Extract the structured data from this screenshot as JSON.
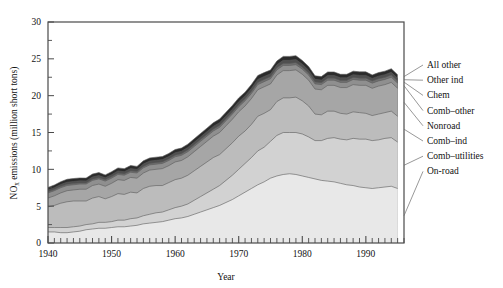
{
  "chart_data": {
    "type": "area",
    "stacked": true,
    "title": "",
    "xlabel": "Year",
    "ylabel": "NOx emissions (million short tons)",
    "ylabel_parts": {
      "prefix": "NO",
      "subscript": "x",
      "suffix": " emissions (million short tons)"
    },
    "xlim": [
      1940,
      1996
    ],
    "ylim": [
      0,
      30
    ],
    "ytick_labels": [
      "0",
      "5",
      "10",
      "15",
      "20",
      "25",
      "30"
    ],
    "ytick_values": [
      0,
      5,
      10,
      15,
      20,
      25,
      30
    ],
    "yminor_step": 2.5,
    "xtick_labels": [
      "1940",
      "1950",
      "1960",
      "1970",
      "1980",
      "1990"
    ],
    "xtick_values": [
      1940,
      1950,
      1960,
      1970,
      1980,
      1990
    ],
    "xminor_step": 1,
    "grid": false,
    "legend_position": "right-outside",
    "legend_order_top_to_bottom": [
      "All other",
      "Other ind",
      "Chem",
      "Comb-other",
      "Nonroad",
      "Comb-ind",
      "Comb-utilities",
      "On-road"
    ],
    "x": [
      1940,
      1941,
      1942,
      1943,
      1944,
      1945,
      1946,
      1947,
      1948,
      1949,
      1950,
      1951,
      1952,
      1953,
      1954,
      1955,
      1956,
      1957,
      1958,
      1959,
      1960,
      1961,
      1962,
      1963,
      1964,
      1965,
      1966,
      1967,
      1968,
      1969,
      1970,
      1971,
      1972,
      1973,
      1974,
      1975,
      1976,
      1977,
      1978,
      1979,
      1980,
      1981,
      1982,
      1983,
      1984,
      1985,
      1986,
      1987,
      1988,
      1989,
      1990,
      1991,
      1992,
      1993,
      1994,
      1995
    ],
    "series": [
      {
        "name": "On-road",
        "color": "#e8e8e8",
        "values": [
          1.5,
          1.5,
          1.4,
          1.4,
          1.5,
          1.6,
          1.8,
          1.9,
          2.0,
          2.0,
          2.1,
          2.2,
          2.2,
          2.3,
          2.4,
          2.6,
          2.7,
          2.8,
          2.9,
          3.1,
          3.3,
          3.4,
          3.6,
          3.9,
          4.2,
          4.5,
          4.8,
          5.1,
          5.5,
          5.9,
          6.4,
          6.9,
          7.4,
          7.9,
          8.3,
          8.8,
          9.1,
          9.3,
          9.4,
          9.3,
          9.1,
          8.9,
          8.7,
          8.5,
          8.4,
          8.3,
          8.1,
          7.9,
          7.8,
          7.6,
          7.5,
          7.4,
          7.5,
          7.6,
          7.7,
          7.4
        ]
      },
      {
        "name": "Comb-utilities",
        "color": "#d2d2d2",
        "values": [
          0.6,
          0.6,
          0.7,
          0.7,
          0.7,
          0.7,
          0.7,
          0.7,
          0.8,
          0.8,
          0.8,
          0.9,
          0.9,
          1.0,
          1.0,
          1.1,
          1.2,
          1.3,
          1.3,
          1.4,
          1.5,
          1.6,
          1.7,
          1.9,
          2.1,
          2.3,
          2.5,
          2.7,
          3.0,
          3.3,
          3.6,
          3.9,
          4.2,
          4.6,
          4.7,
          5.0,
          5.5,
          5.7,
          5.6,
          5.7,
          5.7,
          5.5,
          5.2,
          5.4,
          5.8,
          6.0,
          6.0,
          6.1,
          6.4,
          6.5,
          6.6,
          6.5,
          6.5,
          6.6,
          6.6,
          6.3
        ]
      },
      {
        "name": "Comb-ind",
        "color": "#bcbcbc",
        "values": [
          2.8,
          3.0,
          3.3,
          3.5,
          3.5,
          3.4,
          3.2,
          3.5,
          3.5,
          3.2,
          3.4,
          3.6,
          3.5,
          3.6,
          3.4,
          3.7,
          3.8,
          3.7,
          3.6,
          3.7,
          3.8,
          3.8,
          3.9,
          4.0,
          4.1,
          4.2,
          4.3,
          4.2,
          4.3,
          4.4,
          4.5,
          4.4,
          4.5,
          4.7,
          4.6,
          4.3,
          4.6,
          4.7,
          4.7,
          4.8,
          4.5,
          4.2,
          3.6,
          3.5,
          3.7,
          3.6,
          3.5,
          3.5,
          3.6,
          3.6,
          3.5,
          3.4,
          3.5,
          3.5,
          3.6,
          3.5
        ]
      },
      {
        "name": "Nonroad",
        "color": "#a6a6a6",
        "values": [
          1.2,
          1.3,
          1.4,
          1.5,
          1.5,
          1.6,
          1.6,
          1.7,
          1.7,
          1.7,
          1.8,
          1.9,
          1.9,
          2.0,
          2.0,
          2.1,
          2.2,
          2.2,
          2.3,
          2.3,
          2.4,
          2.4,
          2.5,
          2.6,
          2.7,
          2.8,
          2.9,
          3.0,
          3.1,
          3.2,
          3.3,
          3.4,
          3.5,
          3.6,
          3.6,
          3.5,
          3.6,
          3.7,
          3.7,
          3.7,
          3.6,
          3.5,
          3.4,
          3.4,
          3.5,
          3.5,
          3.5,
          3.6,
          3.7,
          3.7,
          3.8,
          3.7,
          3.8,
          3.8,
          3.9,
          3.8
        ]
      },
      {
        "name": "Comb-other",
        "color": "#8f8f8f",
        "values": [
          0.7,
          0.7,
          0.7,
          0.7,
          0.7,
          0.7,
          0.7,
          0.7,
          0.7,
          0.7,
          0.7,
          0.7,
          0.7,
          0.7,
          0.7,
          0.7,
          0.7,
          0.7,
          0.7,
          0.7,
          0.7,
          0.7,
          0.7,
          0.7,
          0.7,
          0.7,
          0.7,
          0.7,
          0.7,
          0.7,
          0.7,
          0.7,
          0.7,
          0.7,
          0.7,
          0.7,
          0.7,
          0.7,
          0.7,
          0.7,
          0.7,
          0.7,
          0.7,
          0.7,
          0.7,
          0.7,
          0.7,
          0.7,
          0.7,
          0.7,
          0.7,
          0.7,
          0.7,
          0.7,
          0.7,
          0.7
        ]
      },
      {
        "name": "Chem",
        "color": "#707070",
        "values": [
          0.15,
          0.15,
          0.16,
          0.16,
          0.16,
          0.16,
          0.16,
          0.17,
          0.17,
          0.17,
          0.18,
          0.18,
          0.18,
          0.19,
          0.19,
          0.2,
          0.2,
          0.2,
          0.21,
          0.21,
          0.22,
          0.22,
          0.23,
          0.23,
          0.24,
          0.24,
          0.25,
          0.25,
          0.26,
          0.26,
          0.27,
          0.27,
          0.28,
          0.28,
          0.28,
          0.27,
          0.28,
          0.28,
          0.28,
          0.28,
          0.27,
          0.27,
          0.26,
          0.26,
          0.27,
          0.27,
          0.27,
          0.27,
          0.28,
          0.28,
          0.28,
          0.28,
          0.28,
          0.28,
          0.29,
          0.28
        ]
      },
      {
        "name": "Other ind",
        "color": "#4f4f4f",
        "values": [
          0.25,
          0.26,
          0.28,
          0.29,
          0.29,
          0.28,
          0.27,
          0.29,
          0.29,
          0.28,
          0.29,
          0.3,
          0.3,
          0.31,
          0.3,
          0.32,
          0.32,
          0.32,
          0.31,
          0.32,
          0.33,
          0.33,
          0.34,
          0.35,
          0.36,
          0.37,
          0.38,
          0.38,
          0.39,
          0.4,
          0.41,
          0.4,
          0.41,
          0.42,
          0.42,
          0.4,
          0.41,
          0.42,
          0.42,
          0.42,
          0.4,
          0.39,
          0.36,
          0.36,
          0.37,
          0.37,
          0.36,
          0.36,
          0.37,
          0.37,
          0.37,
          0.36,
          0.37,
          0.37,
          0.38,
          0.37
        ]
      },
      {
        "name": "All other",
        "color": "#2b2b2b",
        "values": [
          0.35,
          0.36,
          0.38,
          0.4,
          0.4,
          0.39,
          0.38,
          0.4,
          0.4,
          0.39,
          0.4,
          0.41,
          0.41,
          0.42,
          0.41,
          0.43,
          0.43,
          0.43,
          0.42,
          0.43,
          0.44,
          0.44,
          0.45,
          0.46,
          0.47,
          0.48,
          0.49,
          0.49,
          0.5,
          0.51,
          0.52,
          0.51,
          0.52,
          0.53,
          0.53,
          0.51,
          0.52,
          0.53,
          0.53,
          0.53,
          0.51,
          0.5,
          0.47,
          0.47,
          0.48,
          0.48,
          0.47,
          0.47,
          0.48,
          0.48,
          0.48,
          0.47,
          0.48,
          0.48,
          0.49,
          0.48
        ]
      }
    ]
  },
  "legend": {
    "items": [
      {
        "label": "All other",
        "series": "All other"
      },
      {
        "label": "Other ind",
        "series": "Other ind"
      },
      {
        "label": "Chem",
        "series": "Chem"
      },
      {
        "label": "Comb–other",
        "series": "Comb-other"
      },
      {
        "label": "Nonroad",
        "series": "Nonroad"
      },
      {
        "label": "Comb–ind",
        "series": "Comb-ind"
      },
      {
        "label": "Comb–utilities",
        "series": "Comb-utilities"
      },
      {
        "label": "On-road",
        "series": "On-road"
      }
    ]
  },
  "style": {
    "axis_color": "#4a4a4a",
    "band_outline": "#5a5a5a",
    "background": "#ffffff",
    "leader_color": "#6b6b6b"
  }
}
